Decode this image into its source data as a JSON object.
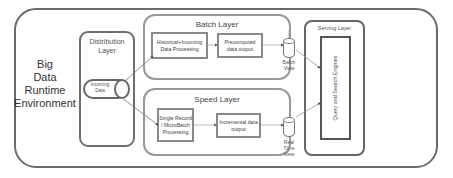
{
  "environment": {
    "label_lines": [
      "Big",
      "Data",
      "Runtime",
      "Environment"
    ]
  },
  "distribution_layer": {
    "title_lines": [
      "Distribution",
      "Layer"
    ],
    "source": {
      "label_lines": [
        "Incoming",
        "Data"
      ]
    }
  },
  "batch_layer": {
    "title": "Batch Layer",
    "processing": "Historical+Incoming Data Processing",
    "output": "Precomputed data output",
    "view_lines": [
      "Batch",
      "View"
    ]
  },
  "speed_layer": {
    "title": "Speed Layer",
    "processing": "Single Record / MicroBatch Processing",
    "output": "Incremental data output",
    "view_lines": [
      "Real",
      "Time",
      "View"
    ]
  },
  "serving_layer": {
    "title": "Serving Layer",
    "engine": "Query and Search Engines"
  },
  "colors": {
    "outer_border": "#6b6b6b",
    "layer_border": "#999999",
    "box_border": "#8a8a8a",
    "line": "#888888"
  }
}
